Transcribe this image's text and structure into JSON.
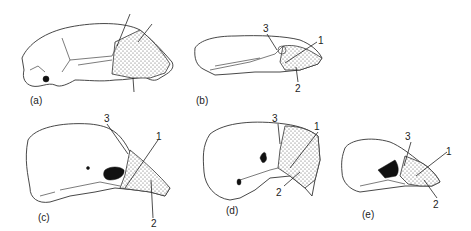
{
  "figure": {
    "panels": [
      {
        "id": "a",
        "caption": "(a)",
        "labels": []
      },
      {
        "id": "b",
        "caption": "(b)",
        "labels": [
          "1",
          "2",
          "3"
        ]
      },
      {
        "id": "c",
        "caption": "(c)",
        "labels": [
          "1",
          "2",
          "3"
        ]
      },
      {
        "id": "d",
        "caption": "(d)",
        "labels": [
          "1",
          "2",
          "3"
        ]
      },
      {
        "id": "e",
        "caption": "(e)",
        "labels": [
          "1",
          "2",
          "3"
        ]
      }
    ],
    "colors": {
      "line": "#333333",
      "stipple": "#555555",
      "fill_dark": "#111111",
      "background": "#ffffff"
    }
  }
}
